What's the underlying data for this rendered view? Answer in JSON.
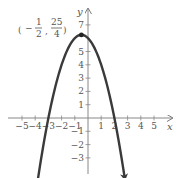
{
  "chart_data": {
    "type": "line",
    "title": "",
    "xlabel": "x",
    "ylabel": "y",
    "xlim": [
      -5.5,
      5.5
    ],
    "ylim": [
      -4,
      7.5
    ],
    "x_ticks": [
      -5,
      -4,
      -3,
      -2,
      -1,
      1,
      2,
      3,
      4,
      5
    ],
    "y_ticks": [
      -3,
      -2,
      -1,
      1,
      2,
      3,
      4,
      5,
      7
    ],
    "x_tick_labels": [
      "−5",
      "−4",
      "−3",
      "−2",
      "−1",
      "1",
      "2",
      "3",
      "4",
      "5"
    ],
    "y_tick_labels": [
      "−3",
      "−2",
      "−1",
      "1",
      "2",
      "3",
      "4",
      "5",
      "7"
    ],
    "grid": false,
    "legend": null,
    "series": [
      {
        "name": "parabola",
        "equation": "y = -x^2 - x + 6",
        "color": "#3a3a3a",
        "x": [
          -3.8,
          -3.5,
          -3,
          -2.5,
          -2,
          -1.5,
          -1,
          -0.5,
          0,
          0.5,
          1,
          1.5,
          2,
          2.5,
          2.8
        ],
        "y": [
          -4.64,
          -2.75,
          0,
          2.25,
          4,
          5.25,
          6,
          6.25,
          6,
          5.25,
          4,
          2.25,
          0,
          -2.75,
          -4.64
        ]
      }
    ],
    "annotations": [
      {
        "type": "point",
        "x": -0.5,
        "y": 6.25,
        "label": "(−1/2, 25/4)",
        "label_parts": {
          "x_num": "1",
          "x_den": "2",
          "x_sign": "−",
          "y_num": "25",
          "y_den": "4"
        }
      }
    ]
  },
  "labels": {
    "x_axis": "x",
    "y_axis": "y",
    "vertex": {
      "open": "(",
      "sign": "−",
      "x_num": "1",
      "x_den": "2",
      "comma": ",",
      "y_num": "25",
      "y_den": "4",
      "close": ")"
    }
  }
}
